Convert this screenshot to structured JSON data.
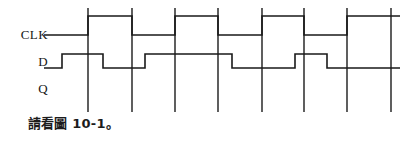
{
  "figure": {
    "kind": "digital-timing-diagram",
    "caption": "請看圖 10-1。",
    "background_color": "#ffffff",
    "line_color": "#1a1a1a",
    "signal_stroke_width": 1.6,
    "gridline_stroke_width": 1.4
  },
  "signals": [
    {
      "id": "clk",
      "label": "CLK"
    },
    {
      "id": "d",
      "label": "D"
    },
    {
      "id": "q",
      "label": "Q"
    }
  ],
  "chart_data": {
    "type": "line",
    "title": "",
    "xlabel": "",
    "ylabel": "",
    "xlim": [
      44,
      400
    ],
    "ylim": [
      8,
      112
    ],
    "grid": true,
    "legend_position": "left-labels",
    "gridlines": {
      "name": "clock-edge-gridlines",
      "orientation": "vertical",
      "y_top": 8,
      "y_bottom": 112,
      "x_positions": [
        88,
        132,
        175,
        218,
        262,
        304,
        347,
        391
      ]
    },
    "series": [
      {
        "name": "CLK",
        "level_high_y": 16,
        "level_low_y": 35,
        "start_x": 44,
        "end_x": 400,
        "start_level": 0,
        "transitions": [
          {
            "x": 88,
            "to": 1
          },
          {
            "x": 132,
            "to": 0
          },
          {
            "x": 175,
            "to": 1
          },
          {
            "x": 218,
            "to": 0
          },
          {
            "x": 262,
            "to": 1
          },
          {
            "x": 304,
            "to": 0
          },
          {
            "x": 347,
            "to": 1
          }
        ]
      },
      {
        "name": "D",
        "level_high_y": 54,
        "level_low_y": 68,
        "start_x": 44,
        "end_x": 400,
        "start_level": 0,
        "transitions": [
          {
            "x": 62,
            "to": 1
          },
          {
            "x": 103,
            "to": 0
          },
          {
            "x": 145,
            "to": 1
          },
          {
            "x": 232,
            "to": 0
          },
          {
            "x": 295,
            "to": 1
          },
          {
            "x": 327,
            "to": 0
          }
        ]
      },
      {
        "name": "Q",
        "level_high_y": 82,
        "level_low_y": 96,
        "start_x": 44,
        "end_x": 400,
        "start_level": null,
        "transitions": [],
        "note": "blank waveform row"
      }
    ]
  }
}
